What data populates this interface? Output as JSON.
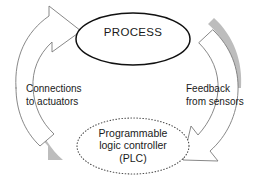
{
  "diagram": {
    "background_color": "#ffffff",
    "nodes": [
      {
        "id": "process",
        "label": "PROCESS",
        "shape": "ellipse",
        "border_style": "solid",
        "border_color": "#111111",
        "fill": "#ffffff"
      },
      {
        "id": "plc",
        "label": "Programmable\nlogic controller\n(PLC)",
        "shape": "ellipse",
        "border_style": "dotted",
        "border_color": "#4d4d4d",
        "fill": "#ffffff"
      }
    ],
    "arrows": [
      {
        "id": "actuators-arrow",
        "label": "Connections\nto actuators",
        "from": "plc",
        "to": "process",
        "direction": "up-right",
        "fill": "#ffffff",
        "outline_color": "#7a7a7a",
        "shadow_color": "#bdbdbd"
      },
      {
        "id": "sensors-arrow",
        "label": "Feedback\nfrom sensors",
        "from": "process",
        "to": "plc",
        "direction": "down-left",
        "fill": "#ffffff",
        "outline_color": "#7a7a7a",
        "shadow_color": "#bdbdbd"
      }
    ]
  }
}
